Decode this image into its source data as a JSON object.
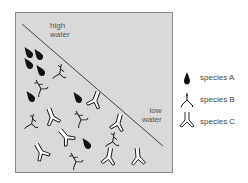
{
  "diagram": {
    "zone_labels": {
      "high_water": [
        "high",
        "water"
      ],
      "low_water": [
        "low",
        "water"
      ]
    },
    "colors": {
      "background": "#d9d9d9",
      "border": "#8a8a8a",
      "line": "#333333",
      "ink": "#111111"
    },
    "legend": [
      {
        "symbol": "teardrop",
        "label": "species A"
      },
      {
        "symbol": "branch",
        "label": "species B"
      },
      {
        "symbol": "y-outline",
        "label": "species C"
      }
    ],
    "organisms": {
      "species_A": [
        [
          28,
          52
        ],
        [
          38,
          54
        ],
        [
          28,
          63
        ],
        [
          40,
          70
        ],
        [
          30,
          96
        ],
        [
          77,
          97
        ],
        [
          86,
          143
        ]
      ],
      "species_B": [
        [
          60,
          72
        ],
        [
          40,
          87
        ],
        [
          32,
          122
        ],
        [
          80,
          118
        ],
        [
          113,
          140
        ],
        [
          75,
          160
        ]
      ],
      "species_C": [
        [
          95,
          100
        ],
        [
          52,
          117
        ],
        [
          66,
          137
        ],
        [
          118,
          123
        ],
        [
          41,
          152
        ],
        [
          109,
          157
        ],
        [
          138,
          157
        ]
      ]
    }
  }
}
